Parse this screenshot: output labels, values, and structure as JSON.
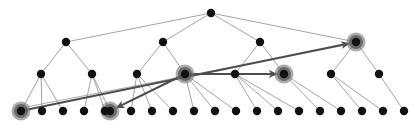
{
  "figure": {
    "type": "diagram",
    "width": 417,
    "height": 129,
    "background": "#ffffff",
    "colors": {
      "node_fill": "#111111",
      "highlight_halo": "#777777",
      "tree_edge": "#999999",
      "arrow": "#4d4d4d",
      "arrow_thin": "#6b6b6b",
      "border": "#d9d9d9"
    },
    "levels": 4,
    "node_radius": {
      "leaf": 4.2,
      "internal": 4.2,
      "root": 4.2,
      "highlight_halo": 9.5
    },
    "nodes": [
      {
        "id": "root",
        "level": 0,
        "x": 211,
        "y": 13,
        "highlight": false
      },
      {
        "id": "L1-0",
        "level": 1,
        "x": 66,
        "y": 42,
        "highlight": false
      },
      {
        "id": "L1-1",
        "level": 1,
        "x": 163,
        "y": 42,
        "highlight": false
      },
      {
        "id": "L1-2",
        "level": 1,
        "x": 260,
        "y": 42,
        "highlight": false
      },
      {
        "id": "L1-3",
        "level": 1,
        "x": 356,
        "y": 42,
        "highlight": true
      },
      {
        "id": "L2-0",
        "level": 2,
        "x": 41,
        "y": 74,
        "highlight": false
      },
      {
        "id": "L2-1",
        "level": 2,
        "x": 92,
        "y": 74,
        "highlight": false
      },
      {
        "id": "L2-2",
        "level": 2,
        "x": 137,
        "y": 74,
        "highlight": false
      },
      {
        "id": "L2-3",
        "level": 2,
        "x": 185,
        "y": 74,
        "highlight": true
      },
      {
        "id": "L2-4",
        "level": 2,
        "x": 235,
        "y": 74,
        "highlight": false
      },
      {
        "id": "L2-5",
        "level": 2,
        "x": 284,
        "y": 74,
        "highlight": true
      },
      {
        "id": "L2-6",
        "level": 2,
        "x": 331,
        "y": 74,
        "highlight": false
      },
      {
        "id": "L2-7",
        "level": 2,
        "x": 379,
        "y": 74,
        "highlight": false
      },
      {
        "id": "L3-0",
        "level": 3,
        "x": 21,
        "y": 111,
        "highlight": true
      },
      {
        "id": "L3-1",
        "level": 3,
        "x": 42,
        "y": 111,
        "highlight": false
      },
      {
        "id": "L3-2",
        "level": 3,
        "x": 63,
        "y": 111,
        "highlight": false
      },
      {
        "id": "L3-3",
        "level": 3,
        "x": 84,
        "y": 111,
        "highlight": false
      },
      {
        "id": "L3-4",
        "level": 3,
        "x": 105,
        "y": 111,
        "highlight": false
      },
      {
        "id": "L3-5",
        "level": 3,
        "x": 110,
        "y": 111,
        "highlight": true
      },
      {
        "id": "L3-6",
        "level": 3,
        "x": 131,
        "y": 111,
        "highlight": false
      },
      {
        "id": "L3-7",
        "level": 3,
        "x": 152,
        "y": 111,
        "highlight": false
      },
      {
        "id": "L3-8",
        "level": 3,
        "x": 173,
        "y": 111,
        "highlight": false
      },
      {
        "id": "L3-9",
        "level": 3,
        "x": 194,
        "y": 111,
        "highlight": false
      },
      {
        "id": "L3-10",
        "level": 3,
        "x": 215,
        "y": 111,
        "highlight": false
      },
      {
        "id": "L3-11",
        "level": 3,
        "x": 236,
        "y": 111,
        "highlight": false
      },
      {
        "id": "L3-12",
        "level": 3,
        "x": 257,
        "y": 111,
        "highlight": false
      },
      {
        "id": "L3-13",
        "level": 3,
        "x": 278,
        "y": 111,
        "highlight": false
      },
      {
        "id": "L3-14",
        "level": 3,
        "x": 299,
        "y": 111,
        "highlight": false
      },
      {
        "id": "L3-15",
        "level": 3,
        "x": 320,
        "y": 111,
        "highlight": false
      },
      {
        "id": "L3-16",
        "level": 3,
        "x": 341,
        "y": 111,
        "highlight": false
      },
      {
        "id": "L3-17",
        "level": 3,
        "x": 362,
        "y": 111,
        "highlight": false
      },
      {
        "id": "L3-18",
        "level": 3,
        "x": 383,
        "y": 111,
        "highlight": false
      },
      {
        "id": "L3-19",
        "level": 3,
        "x": 404,
        "y": 111,
        "highlight": false
      }
    ],
    "tree_edges": [
      [
        "root",
        "L1-0"
      ],
      [
        "root",
        "L1-1"
      ],
      [
        "root",
        "L1-2"
      ],
      [
        "root",
        "L1-3"
      ],
      [
        "L1-0",
        "L2-0"
      ],
      [
        "L1-0",
        "L2-1"
      ],
      [
        "L1-1",
        "L2-2"
      ],
      [
        "L1-1",
        "L2-3"
      ],
      [
        "L1-2",
        "L2-4"
      ],
      [
        "L1-2",
        "L2-5"
      ],
      [
        "L1-3",
        "L2-6"
      ],
      [
        "L1-3",
        "L2-7"
      ],
      [
        "L2-0",
        "L3-0"
      ],
      [
        "L2-0",
        "L3-1"
      ],
      [
        "L2-0",
        "L3-2"
      ],
      [
        "L2-1",
        "L3-3"
      ],
      [
        "L2-1",
        "L3-4"
      ],
      [
        "L2-1",
        "L3-5"
      ],
      [
        "L2-2",
        "L3-6"
      ],
      [
        "L2-2",
        "L3-7"
      ],
      [
        "L2-2",
        "L3-8"
      ],
      [
        "L2-3",
        "L3-9"
      ],
      [
        "L2-3",
        "L3-10"
      ],
      [
        "L2-3",
        "L3-11"
      ],
      [
        "L2-4",
        "L3-12"
      ],
      [
        "L2-4",
        "L3-13"
      ],
      [
        "L2-4",
        "L3-14"
      ],
      [
        "L2-5",
        "L3-15"
      ],
      [
        "L2-5",
        "L3-16"
      ],
      [
        "L2-6",
        "L3-17"
      ],
      [
        "L2-6",
        "L3-18"
      ],
      [
        "L2-7",
        "L3-19"
      ]
    ],
    "arrows": [
      {
        "id": "arrow-leaf-to-highlight-right",
        "from": "L3-0",
        "to": "L1-3",
        "from_x": 21,
        "from_y": 111,
        "to_x": 356,
        "to_y": 42,
        "width": 2.1,
        "style": "solid"
      },
      {
        "id": "arrow-internal-to-internal",
        "from": "L2-3",
        "to": "L2-5",
        "from_x": 185,
        "from_y": 74,
        "to_x": 284,
        "to_y": 74,
        "width": 2.1,
        "style": "solid"
      },
      {
        "id": "arrow-internal-to-leaf",
        "from": "L2-3",
        "to": "L3-5",
        "from_x": 185,
        "from_y": 74,
        "to_x": 110,
        "to_y": 111,
        "width": 2.1,
        "style": "solid"
      }
    ],
    "thin_arrows": [
      {
        "id": "thin-arrow-leaf-to-root-branch",
        "from_x": 21,
        "from_y": 108,
        "to_x": 351,
        "to_y": 44,
        "width": 0.8
      }
    ],
    "caption": ""
  }
}
